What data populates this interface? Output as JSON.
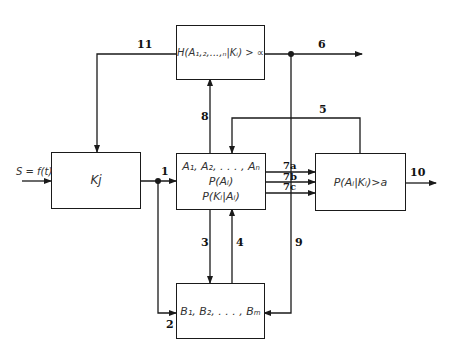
{
  "diagram": {
    "input": {
      "label": "S = f(t)"
    },
    "boxes": {
      "entropy": {
        "text": "H(A₁,₂,...,ₙ|Kᵢ) > ∝"
      },
      "classifier": {
        "text": "Kj"
      },
      "hypotheses": {
        "lines": [
          "A₁, A₂, . . . , Aₙ",
          "P(Aᵢ)",
          "P(Kᵢ|Aᵢ)"
        ]
      },
      "decision": {
        "text": "P(Aᵢ|Kᵢ)>a"
      },
      "features": {
        "text": "B₁, B₂, . . . , Bₘ"
      }
    },
    "edges": {
      "e1": "1",
      "e2": "2",
      "e3": "3",
      "e4": "4",
      "e5": "5",
      "e6": "6",
      "e7a": "7a",
      "e7b": "7b",
      "e7c": "7c",
      "e8": "8",
      "e9": "9",
      "e10": "10",
      "e11": "11"
    },
    "colors": {
      "line": "#1a1a1a",
      "text": "#333333"
    }
  }
}
